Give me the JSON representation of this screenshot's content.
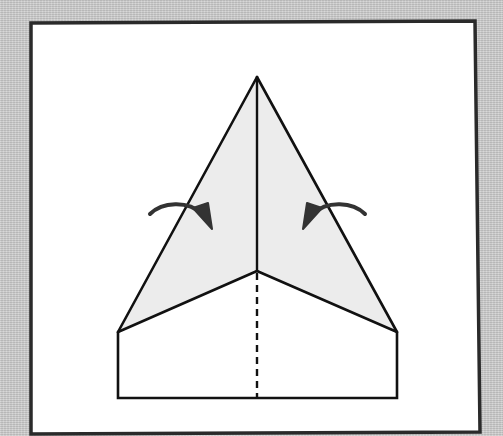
{
  "diagram": {
    "type": "origami-fold-instruction",
    "step_description": "Fold the top edges in toward the center crease",
    "colors": {
      "backdrop": "#c9c9c9",
      "paper": "#ffffff",
      "folded_flap": "#ececec",
      "line": "#111111",
      "arrow": "#333333",
      "frame": "#2a2a2a"
    },
    "elements": {
      "frame": "white panel with dark border",
      "nose_triangle": "shaded folded flaps forming a point",
      "center_crease": "solid vertical line from apex",
      "valley_fold_line": "dashed vertical line on lower body",
      "bottom_rectangle": "unfolded lower portion of paper",
      "left_arrow": "curved arrow pointing right toward center",
      "right_arrow": "curved arrow pointing left toward center"
    }
  }
}
